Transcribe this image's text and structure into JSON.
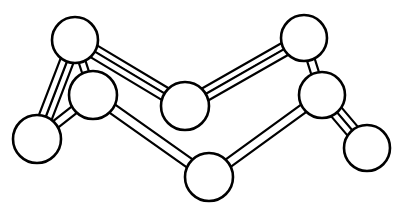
{
  "figure": {
    "width": 406,
    "height": 217,
    "background_color": "#ffffff",
    "line_color": "#000000",
    "fill_color": "#ffffff",
    "atom_stroke_width": 2.6,
    "bond_stroke_width": 2.2
  },
  "atoms": [
    {
      "id": "a1",
      "label": "top-left-atom",
      "cx": 75,
      "cy": 40,
      "r": 23
    },
    {
      "id": "a2",
      "label": "upper-mid-left-atom",
      "cx": 93,
      "cy": 95,
      "r": 24
    },
    {
      "id": "a3",
      "label": "lower-left-atom",
      "cx": 37,
      "cy": 139,
      "r": 24
    },
    {
      "id": "a4",
      "label": "center-atom",
      "cx": 185,
      "cy": 106,
      "r": 24
    },
    {
      "id": "a5",
      "label": "bottom-center-atom",
      "cx": 209,
      "cy": 177,
      "r": 24
    },
    {
      "id": "a6",
      "label": "top-right-atom",
      "cx": 304,
      "cy": 38,
      "r": 23
    },
    {
      "id": "a7",
      "label": "upper-mid-right-atom",
      "cx": 322,
      "cy": 95,
      "r": 23
    },
    {
      "id": "a8",
      "label": "bottom-right-atom",
      "cx": 367,
      "cy": 148,
      "r": 23
    }
  ],
  "bonds": [
    {
      "id": "b1",
      "label": "bond-a1-a2",
      "from": "a1",
      "to": "a2",
      "order": 1,
      "width": 7
    },
    {
      "id": "b2",
      "label": "bond-a1-a3",
      "from": "a1",
      "to": "a3",
      "order": 2,
      "width": 7
    },
    {
      "id": "b3",
      "label": "bond-a1-a4",
      "from": "a1",
      "to": "a4",
      "order": 2,
      "width": 7
    },
    {
      "id": "b4",
      "label": "bond-a2-a3",
      "from": "a2",
      "to": "a3",
      "order": 1,
      "width": 8
    },
    {
      "id": "b5",
      "label": "bond-a2-a5",
      "from": "a2",
      "to": "a5",
      "order": 1,
      "width": 10
    },
    {
      "id": "b6",
      "label": "bond-a4-a6",
      "from": "a4",
      "to": "a6",
      "order": 2,
      "width": 7
    },
    {
      "id": "b7",
      "label": "bond-a5-a7",
      "from": "a5",
      "to": "a7",
      "order": 1,
      "width": 9
    },
    {
      "id": "b8",
      "label": "bond-a6-a7",
      "from": "a6",
      "to": "a7",
      "order": 1,
      "width": 8
    },
    {
      "id": "b9",
      "label": "bond-a7-a8",
      "from": "a7",
      "to": "a8",
      "order": 2,
      "width": 7
    }
  ]
}
